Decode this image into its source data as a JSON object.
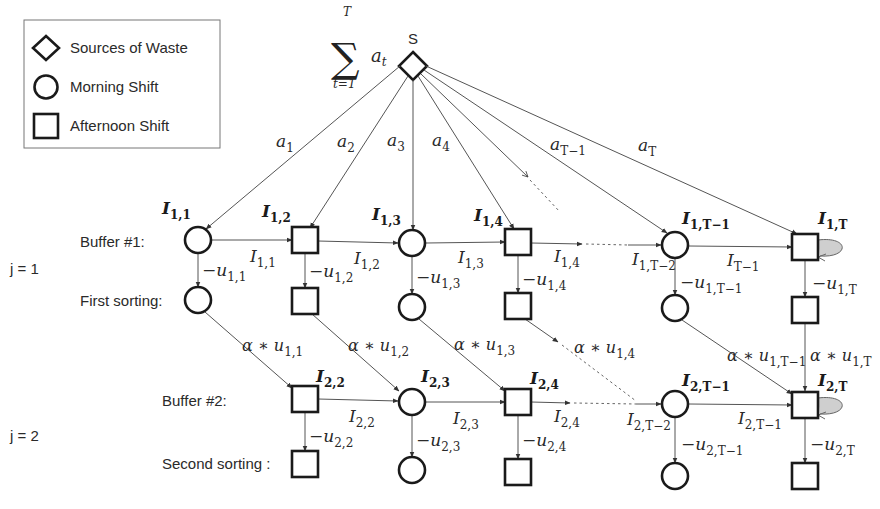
{
  "legend": {
    "items": [
      {
        "shape": "diamond",
        "label": "Sources of Waste"
      },
      {
        "shape": "circle",
        "label": "Morning Shift"
      },
      {
        "shape": "square",
        "label": "Afternoon Shift"
      }
    ]
  },
  "source": {
    "label": "S",
    "sum_symbol": "∑",
    "sum_upper": "T",
    "sum_lower": "t=1",
    "sum_term": "a",
    "sum_term_sub": "t"
  },
  "row_labels": {
    "j1": "j = 1",
    "j2": "j = 2",
    "buffer1": "Buffer #1:",
    "first_sorting": "First sorting:",
    "buffer2": "Buffer #2:",
    "second_sorting": "Second sorting :"
  },
  "arrivals": [
    {
      "base": "a",
      "sub": "1"
    },
    {
      "base": "a",
      "sub": "2"
    },
    {
      "base": "a",
      "sub": "3"
    },
    {
      "base": "a",
      "sub": "4"
    },
    {
      "base": "a",
      "sub": "T−1"
    },
    {
      "base": "a",
      "sub": "T"
    }
  ],
  "stage1": {
    "nodes": [
      {
        "label": "I",
        "sub": "1,1",
        "shape": "circle"
      },
      {
        "label": "I",
        "sub": "1,2",
        "shape": "square"
      },
      {
        "label": "I",
        "sub": "1,3",
        "shape": "circle"
      },
      {
        "label": "I",
        "sub": "1,4",
        "shape": "square"
      },
      {
        "label": "I",
        "sub": "1,T−1",
        "shape": "circle"
      },
      {
        "label": "I",
        "sub": "1,T",
        "shape": "square"
      }
    ],
    "inventory_edges": [
      {
        "base": "I",
        "sub": "1,1"
      },
      {
        "base": "I",
        "sub": "1,2"
      },
      {
        "base": "I",
        "sub": "1,3"
      },
      {
        "base": "I",
        "sub": "1,4"
      },
      {
        "base": "I",
        "sub": "1,T−2"
      },
      {
        "base": "I",
        "sub": "T−1"
      }
    ],
    "sorting_edges": [
      {
        "base": "−u",
        "sub": "1,1"
      },
      {
        "base": "−u",
        "sub": "1,2"
      },
      {
        "base": "−u",
        "sub": "1,3"
      },
      {
        "base": "−u",
        "sub": "1,4"
      },
      {
        "base": "−u",
        "sub": "1,T−1"
      },
      {
        "base": "−u",
        "sub": "1,T"
      }
    ]
  },
  "transfer_edges": [
    {
      "base": "α ∗ u",
      "sub": "1,1"
    },
    {
      "base": "α ∗ u",
      "sub": "1,2"
    },
    {
      "base": "α ∗ u",
      "sub": "1,3"
    },
    {
      "base": "α ∗ u",
      "sub": "1,4"
    },
    {
      "base": "α ∗ u",
      "sub": "1,T−1"
    },
    {
      "base": "α ∗ u",
      "sub": "1,T"
    }
  ],
  "stage2": {
    "nodes": [
      {
        "label": "I",
        "sub": "2,2",
        "shape": "square"
      },
      {
        "label": "I",
        "sub": "2,3",
        "shape": "circle"
      },
      {
        "label": "I",
        "sub": "2,4",
        "shape": "square"
      },
      {
        "label": "I",
        "sub": "2,T−1",
        "shape": "circle"
      },
      {
        "label": "I",
        "sub": "2,T",
        "shape": "square"
      }
    ],
    "inventory_edges": [
      {
        "base": "I",
        "sub": "2,2"
      },
      {
        "base": "I",
        "sub": "2,3"
      },
      {
        "base": "I",
        "sub": "2,4"
      },
      {
        "base": "I",
        "sub": "2,T−2"
      },
      {
        "base": "I",
        "sub": "2,T−1"
      }
    ],
    "sorting_edges": [
      {
        "base": "−u",
        "sub": "2,2"
      },
      {
        "base": "−u",
        "sub": "2,3"
      },
      {
        "base": "−u",
        "sub": "2,4"
      },
      {
        "base": "−u",
        "sub": "2,T−1"
      },
      {
        "base": "−u",
        "sub": "2,T"
      }
    ]
  }
}
